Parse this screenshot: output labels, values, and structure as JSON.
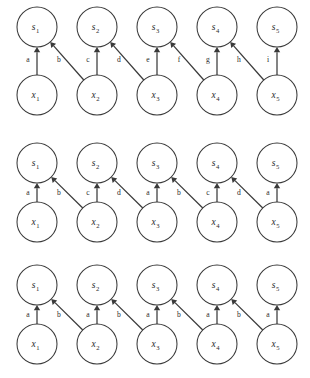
{
  "figure": {
    "title": "",
    "background_color": "#ffffff",
    "stroke_color": "#3a3a3a",
    "text_color": "#2a2a2a",
    "width": 310,
    "height": 378
  },
  "graph_layout": {
    "columns": 5,
    "column_x": [
      37,
      97,
      157,
      217,
      277
    ],
    "node_radius": 20,
    "top_row_label_prefix": "s",
    "bottom_row_label_prefix": "x"
  },
  "panels": [
    {
      "id": "panel-1",
      "top_row_y": 27,
      "bottom_row_y": 95,
      "label_y": 62,
      "top_nodes": [
        {
          "base": "s",
          "sub": "1"
        },
        {
          "base": "s",
          "sub": "2"
        },
        {
          "base": "s",
          "sub": "3"
        },
        {
          "base": "s",
          "sub": "4"
        },
        {
          "base": "s",
          "sub": "5"
        }
      ],
      "bottom_nodes": [
        {
          "base": "x",
          "sub": "1"
        },
        {
          "base": "x",
          "sub": "2"
        },
        {
          "base": "x",
          "sub": "3"
        },
        {
          "base": "x",
          "sub": "4"
        },
        {
          "base": "x",
          "sub": "5"
        }
      ],
      "edges": [
        {
          "from": "x1",
          "to": "s1",
          "kind": "vertical",
          "from_col": 0,
          "to_col": 0,
          "label": "a",
          "label_x": 28
        },
        {
          "from": "x2",
          "to": "s1",
          "kind": "diagonal",
          "from_col": 1,
          "to_col": 0,
          "label": "b",
          "label_x": 59
        },
        {
          "from": "x2",
          "to": "s2",
          "kind": "vertical",
          "from_col": 1,
          "to_col": 1,
          "label": "c",
          "label_x": 88
        },
        {
          "from": "x3",
          "to": "s2",
          "kind": "diagonal",
          "from_col": 2,
          "to_col": 1,
          "label": "d",
          "label_x": 119
        },
        {
          "from": "x3",
          "to": "s3",
          "kind": "vertical",
          "from_col": 2,
          "to_col": 2,
          "label": "e",
          "label_x": 148
        },
        {
          "from": "x4",
          "to": "s3",
          "kind": "diagonal",
          "from_col": 3,
          "to_col": 2,
          "label": "f",
          "label_x": 179
        },
        {
          "from": "x4",
          "to": "s4",
          "kind": "vertical",
          "from_col": 3,
          "to_col": 3,
          "label": "g",
          "label_x": 208
        },
        {
          "from": "x5",
          "to": "s4",
          "kind": "diagonal",
          "from_col": 4,
          "to_col": 3,
          "label": "h",
          "label_x": 239
        },
        {
          "from": "x5",
          "to": "s5",
          "kind": "vertical",
          "from_col": 4,
          "to_col": 4,
          "label": "i",
          "label_x": 268
        }
      ]
    },
    {
      "id": "panel-2",
      "top_row_y": 163,
      "bottom_row_y": 222,
      "label_y": 195,
      "top_nodes": [
        {
          "base": "s",
          "sub": "1"
        },
        {
          "base": "s",
          "sub": "2"
        },
        {
          "base": "s",
          "sub": "3"
        },
        {
          "base": "s",
          "sub": "4"
        },
        {
          "base": "s",
          "sub": "5"
        }
      ],
      "bottom_nodes": [
        {
          "base": "x",
          "sub": "1"
        },
        {
          "base": "x",
          "sub": "2"
        },
        {
          "base": "x",
          "sub": "3"
        },
        {
          "base": "x",
          "sub": "4"
        },
        {
          "base": "x",
          "sub": "5"
        }
      ],
      "edges": [
        {
          "from": "x1",
          "to": "s1",
          "kind": "vertical",
          "from_col": 0,
          "to_col": 0,
          "label": "a",
          "label_x": 28
        },
        {
          "from": "x2",
          "to": "s1",
          "kind": "diagonal",
          "from_col": 1,
          "to_col": 0,
          "label": "b",
          "label_x": 59
        },
        {
          "from": "x2",
          "to": "s2",
          "kind": "vertical",
          "from_col": 1,
          "to_col": 1,
          "label": "c",
          "label_x": 88
        },
        {
          "from": "x3",
          "to": "s2",
          "kind": "diagonal",
          "from_col": 2,
          "to_col": 1,
          "label": "d",
          "label_x": 119
        },
        {
          "from": "x3",
          "to": "s3",
          "kind": "vertical",
          "from_col": 2,
          "to_col": 2,
          "label": "a",
          "label_x": 148
        },
        {
          "from": "x4",
          "to": "s3",
          "kind": "diagonal",
          "from_col": 3,
          "to_col": 2,
          "label": "b",
          "label_x": 179
        },
        {
          "from": "x4",
          "to": "s4",
          "kind": "vertical",
          "from_col": 3,
          "to_col": 3,
          "label": "c",
          "label_x": 208
        },
        {
          "from": "x5",
          "to": "s4",
          "kind": "diagonal",
          "from_col": 4,
          "to_col": 3,
          "label": "d",
          "label_x": 239
        },
        {
          "from": "x5",
          "to": "s5",
          "kind": "vertical",
          "from_col": 4,
          "to_col": 4,
          "label": "a",
          "label_x": 268
        }
      ]
    },
    {
      "id": "panel-3",
      "top_row_y": 285,
      "bottom_row_y": 344,
      "label_y": 317,
      "top_nodes": [
        {
          "base": "s",
          "sub": "1"
        },
        {
          "base": "s",
          "sub": "2"
        },
        {
          "base": "s",
          "sub": "3"
        },
        {
          "base": "s",
          "sub": "4"
        },
        {
          "base": "s",
          "sub": "5"
        }
      ],
      "bottom_nodes": [
        {
          "base": "x",
          "sub": "1"
        },
        {
          "base": "x",
          "sub": "2"
        },
        {
          "base": "x",
          "sub": "3"
        },
        {
          "base": "x",
          "sub": "4"
        },
        {
          "base": "x",
          "sub": "5"
        }
      ],
      "edges": [
        {
          "from": "x1",
          "to": "s1",
          "kind": "vertical",
          "from_col": 0,
          "to_col": 0,
          "label": "a",
          "label_x": 28
        },
        {
          "from": "x2",
          "to": "s1",
          "kind": "diagonal",
          "from_col": 1,
          "to_col": 0,
          "label": "b",
          "label_x": 59
        },
        {
          "from": "x2",
          "to": "s2",
          "kind": "vertical",
          "from_col": 1,
          "to_col": 1,
          "label": "a",
          "label_x": 88
        },
        {
          "from": "x3",
          "to": "s2",
          "kind": "diagonal",
          "from_col": 2,
          "to_col": 1,
          "label": "b",
          "label_x": 119
        },
        {
          "from": "x3",
          "to": "s3",
          "kind": "vertical",
          "from_col": 2,
          "to_col": 2,
          "label": "a",
          "label_x": 148
        },
        {
          "from": "x4",
          "to": "s3",
          "kind": "diagonal",
          "from_col": 3,
          "to_col": 2,
          "label": "b",
          "label_x": 179
        },
        {
          "from": "x4",
          "to": "s4",
          "kind": "vertical",
          "from_col": 3,
          "to_col": 3,
          "label": "a",
          "label_x": 208
        },
        {
          "from": "x5",
          "to": "s4",
          "kind": "diagonal",
          "from_col": 4,
          "to_col": 3,
          "label": "b",
          "label_x": 239
        },
        {
          "from": "x5",
          "to": "s5",
          "kind": "vertical",
          "from_col": 4,
          "to_col": 4,
          "label": "a",
          "label_x": 268
        }
      ]
    }
  ]
}
